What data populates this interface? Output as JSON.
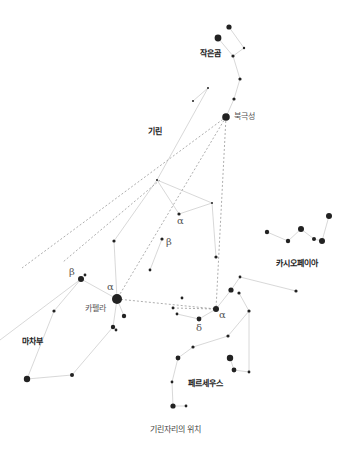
{
  "caption": "기린자리의 위치",
  "colors": {
    "star": "#222222",
    "line": "#d4d4d4",
    "dash": "#999999",
    "text": "#222222"
  },
  "constellations": {
    "ursa_minor": {
      "label": "작은곰",
      "x": 200,
      "y": 53
    },
    "camelopardalis": {
      "label": "기린",
      "x": 150,
      "y": 132
    },
    "cassiopeia": {
      "label": "카시오페이아",
      "x": 275,
      "y": 262
    },
    "auriga": {
      "label": "마차부",
      "x": 20,
      "y": 341
    },
    "perseus": {
      "label": "페르세우스",
      "x": 188,
      "y": 382
    }
  },
  "star_labels": {
    "polaris": {
      "label": "북극성",
      "x": 234,
      "y": 114
    },
    "capella": {
      "label": "카펠라",
      "x": 86,
      "y": 306
    }
  },
  "greek": [
    {
      "symbol": "α",
      "x": 177,
      "y": 217
    },
    {
      "symbol": "β",
      "x": 164,
      "y": 238
    },
    {
      "symbol": "β",
      "x": 69,
      "y": 268
    },
    {
      "symbol": "α",
      "x": 106,
      "y": 282
    },
    {
      "symbol": "α",
      "x": 217,
      "y": 311
    },
    {
      "symbol": "δ",
      "x": 196,
      "y": 322
    }
  ],
  "stars": [
    {
      "x": 229,
      "y": 27,
      "r": 2.6
    },
    {
      "x": 218,
      "y": 38,
      "r": 3.4
    },
    {
      "x": 244,
      "y": 48,
      "r": 1.2
    },
    {
      "x": 233,
      "y": 56,
      "r": 1.6
    },
    {
      "x": 240,
      "y": 79,
      "r": 1.6
    },
    {
      "x": 234,
      "y": 99,
      "r": 1.6
    },
    {
      "x": 226,
      "y": 117,
      "r": 3.8
    },
    {
      "x": 208,
      "y": 88,
      "r": 1
    },
    {
      "x": 193,
      "y": 101,
      "r": 1
    },
    {
      "x": 157,
      "y": 180,
      "r": 1
    },
    {
      "x": 212,
      "y": 203,
      "r": 1
    },
    {
      "x": 179,
      "y": 214,
      "r": 1.6
    },
    {
      "x": 162,
      "y": 239,
      "r": 1.6
    },
    {
      "x": 150,
      "y": 270,
      "r": 1.4
    },
    {
      "x": 216,
      "y": 257,
      "r": 1.6
    },
    {
      "x": 114,
      "y": 241,
      "r": 1.6
    },
    {
      "x": 81,
      "y": 279,
      "r": 3
    },
    {
      "x": 85,
      "y": 275,
      "r": 1.4
    },
    {
      "x": 117,
      "y": 299,
      "r": 5
    },
    {
      "x": 124,
      "y": 316,
      "r": 2.2
    },
    {
      "x": 113,
      "y": 327,
      "r": 2.2
    },
    {
      "x": 116,
      "y": 330,
      "r": 1.4
    },
    {
      "x": 54,
      "y": 311,
      "r": 1.6
    },
    {
      "x": 27,
      "y": 379,
      "r": 3.2
    },
    {
      "x": 72,
      "y": 375,
      "r": 2
    },
    {
      "x": 182,
      "y": 298,
      "r": 1.4
    },
    {
      "x": 173,
      "y": 308,
      "r": 1.4
    },
    {
      "x": 177,
      "y": 314,
      "r": 1.4
    },
    {
      "x": 199,
      "y": 319,
      "r": 2.4
    },
    {
      "x": 216,
      "y": 309,
      "r": 3
    },
    {
      "x": 231,
      "y": 290,
      "r": 2.6
    },
    {
      "x": 240,
      "y": 277,
      "r": 1.4
    },
    {
      "x": 239,
      "y": 293,
      "r": 1.6
    },
    {
      "x": 249,
      "y": 311,
      "r": 1.6
    },
    {
      "x": 228,
      "y": 336,
      "r": 1.6
    },
    {
      "x": 193,
      "y": 347,
      "r": 1.6
    },
    {
      "x": 178,
      "y": 358,
      "r": 2.4
    },
    {
      "x": 230,
      "y": 358,
      "r": 3.2
    },
    {
      "x": 234,
      "y": 370,
      "r": 2.4
    },
    {
      "x": 249,
      "y": 372,
      "r": 1.4
    },
    {
      "x": 172,
      "y": 382,
      "r": 1.4
    },
    {
      "x": 173,
      "y": 406,
      "r": 2.6
    },
    {
      "x": 186,
      "y": 406,
      "r": 1.4
    },
    {
      "x": 296,
      "y": 291,
      "r": 1.6
    },
    {
      "x": 267,
      "y": 232,
      "r": 2.2
    },
    {
      "x": 288,
      "y": 241,
      "r": 2.2
    },
    {
      "x": 301,
      "y": 229,
      "r": 3
    },
    {
      "x": 314,
      "y": 239,
      "r": 2
    },
    {
      "x": 322,
      "y": 241,
      "r": 3
    },
    {
      "x": 329,
      "y": 216,
      "r": 3
    }
  ],
  "lines": [
    [
      229,
      27,
      244,
      48
    ],
    [
      218,
      38,
      233,
      56
    ],
    [
      244,
      48,
      233,
      56
    ],
    [
      233,
      56,
      240,
      79
    ],
    [
      240,
      79,
      234,
      99
    ],
    [
      234,
      99,
      226,
      117
    ],
    [
      208,
      88,
      193,
      101
    ],
    [
      208,
      88,
      157,
      180
    ],
    [
      157,
      180,
      212,
      203
    ],
    [
      157,
      180,
      179,
      214
    ],
    [
      179,
      214,
      212,
      203
    ],
    [
      212,
      203,
      216,
      257
    ],
    [
      162,
      239,
      150,
      270
    ],
    [
      157,
      180,
      114,
      241
    ],
    [
      114,
      241,
      117,
      299
    ],
    [
      81,
      279,
      117,
      299
    ],
    [
      81,
      279,
      0,
      340
    ],
    [
      117,
      299,
      124,
      316
    ],
    [
      117,
      299,
      113,
      327
    ],
    [
      113,
      327,
      72,
      375
    ],
    [
      72,
      375,
      27,
      379
    ],
    [
      27,
      379,
      54,
      311
    ],
    [
      54,
      311,
      81,
      279
    ],
    [
      177,
      314,
      199,
      319
    ],
    [
      199,
      319,
      216,
      309
    ],
    [
      216,
      309,
      231,
      290
    ],
    [
      231,
      290,
      240,
      277
    ],
    [
      240,
      277,
      296,
      291
    ],
    [
      239,
      293,
      249,
      311
    ],
    [
      249,
      311,
      228,
      336
    ],
    [
      249,
      311,
      249,
      372
    ],
    [
      249,
      372,
      234,
      370
    ],
    [
      234,
      370,
      230,
      358
    ],
    [
      228,
      336,
      193,
      347
    ],
    [
      193,
      347,
      178,
      358
    ],
    [
      178,
      358,
      172,
      382
    ],
    [
      172,
      382,
      173,
      406
    ],
    [
      173,
      406,
      186,
      406
    ],
    [
      267,
      232,
      288,
      241
    ],
    [
      288,
      241,
      301,
      229
    ],
    [
      301,
      229,
      314,
      239
    ],
    [
      314,
      239,
      322,
      241
    ],
    [
      322,
      241,
      329,
      216
    ]
  ],
  "dashed": [
    [
      226,
      117,
      22,
      268
    ],
    [
      226,
      117,
      117,
      299
    ],
    [
      226,
      117,
      216,
      309
    ],
    [
      117,
      299,
      216,
      309
    ],
    [
      160,
      180,
      63,
      262
    ],
    [
      173,
      308,
      216,
      309
    ]
  ]
}
